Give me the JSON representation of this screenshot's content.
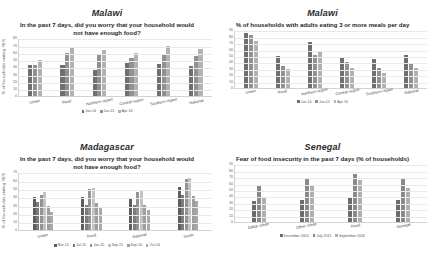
{
  "figure": {
    "y_axis_label": "% of households stating YES"
  },
  "panels": [
    {
      "id": "malawi-worry",
      "country": "Malawi",
      "subtitle": "In the past 7 days, did you worry that your household would not have enough food?",
      "ylabel": "% of households stating YES",
      "legend_labels": [
        "Jun-14",
        "Jun-15",
        "Apr-16"
      ]
    },
    {
      "id": "malawi-meals",
      "country": "Malawi",
      "subtitle": "% of households with adults eating 3 or more meals per day",
      "ylabel": "",
      "legend_labels": [
        "Jun-14",
        "Jun-15",
        "Apr-16"
      ]
    },
    {
      "id": "madagascar-worry",
      "country": "Madagascar",
      "subtitle": "In the past 7 days, did you worry that your household would not have enough food?",
      "ylabel": "% of households stating YES",
      "legend_labels": [
        "Mar-14",
        "Jul-14",
        "Jan-15",
        "Sep-15",
        "Sep-16",
        "Oct-16"
      ]
    },
    {
      "id": "senegal-fear",
      "country": "Senegal",
      "subtitle": "Fear of food insecurity in the past 7 days (% of households)",
      "ylabel": "",
      "legend_labels": [
        "December 2014",
        "July 2015",
        "September 2016"
      ]
    }
  ],
  "chart_data": [
    {
      "type": "bar",
      "id": "malawi-worry",
      "title": "Malawi",
      "subtitle": "In the past 7 days, did you worry that your household would not have enough food?",
      "xlabel": "",
      "ylabel": "% of households stating YES",
      "ylim": [
        0,
        80
      ],
      "yticks": [
        0,
        10,
        20,
        30,
        40,
        50,
        60,
        70,
        80
      ],
      "grid": true,
      "legend_position": "bottom",
      "categories": [
        "Urban",
        "Rural",
        "Northern region",
        "Central region",
        "Southern region",
        "National"
      ],
      "series": [
        {
          "name": "Jun-14",
          "color": "#6f6f6f",
          "values": [
            44,
            44,
            36,
            46,
            45,
            42
          ]
        },
        {
          "name": "Jun-15",
          "color": "#919191",
          "values": [
            43,
            60,
            58,
            53,
            59,
            56
          ]
        },
        {
          "name": "Apr-16",
          "color": "#b3b3b3",
          "values": [
            50,
            68,
            64,
            60,
            70,
            66
          ]
        }
      ]
    },
    {
      "type": "bar",
      "id": "malawi-meals",
      "title": "Malawi",
      "subtitle": "% of households with adults eating 3 or more meals per day",
      "xlabel": "",
      "ylabel": "",
      "ylim": [
        0,
        90
      ],
      "yticks": [
        0,
        10,
        20,
        30,
        40,
        50,
        60,
        70,
        80,
        90
      ],
      "grid": true,
      "legend_position": "bottom",
      "categories": [
        "Urban",
        "Rural",
        "Northern region",
        "Central region",
        "Southern region",
        "National"
      ],
      "series": [
        {
          "name": "Jun-14",
          "color": "#6f6f6f",
          "values": [
            85,
            50,
            72,
            49,
            46,
            52
          ]
        },
        {
          "name": "Jun-15",
          "color": "#919191",
          "values": [
            83,
            35,
            51,
            40,
            32,
            37
          ]
        },
        {
          "name": "Apr-16",
          "color": "#b3b3b3",
          "values": [
            74,
            30,
            56,
            32,
            24,
            31
          ]
        }
      ]
    },
    {
      "type": "bar",
      "id": "madagascar-worry",
      "title": "Madagascar",
      "subtitle": "In the past 7 days, did you worry that your household would not have enough food?",
      "xlabel": "",
      "ylabel": "% of households stating YES",
      "ylim": [
        0,
        70
      ],
      "yticks": [
        0,
        10,
        20,
        30,
        40,
        50,
        60,
        70
      ],
      "grid": true,
      "legend_position": "bottom",
      "categories": [
        "Urban",
        "Rural",
        "National",
        "South"
      ],
      "series": [
        {
          "name": "Mar-14",
          "color": "#5e5e5e",
          "values": [
            40,
            40,
            38,
            52
          ]
        },
        {
          "name": "Jul-14",
          "color": "#7d7d7d",
          "values": [
            34,
            31,
            31,
            43
          ]
        },
        {
          "name": "Jan-15",
          "color": "#949494",
          "values": [
            43,
            50,
            46,
            62
          ]
        },
        {
          "name": "Sep-15",
          "color": "#c3c3c3",
          "values": [
            46,
            51,
            49,
            63
          ]
        },
        {
          "name": "Sep-16",
          "color": "#9e9e9e",
          "values": [
            30,
            33,
            31,
            42
          ]
        },
        {
          "name": "Oct-16",
          "color": "#a8a8a8",
          "values": [
            22,
            28,
            25,
            35
          ]
        }
      ]
    },
    {
      "type": "bar",
      "id": "senegal-fear",
      "title": "Senegal",
      "subtitle": "Fear of food insecurity in the past 7 days (% of households)",
      "xlabel": "",
      "ylabel": "",
      "ylim": [
        0,
        90
      ],
      "yticks": [
        0,
        10,
        20,
        30,
        40,
        50,
        60,
        70,
        80,
        90
      ],
      "grid": true,
      "legend_position": "bottom",
      "categories": [
        "Dakar urban",
        "Other urban",
        "Rural",
        "Senegal"
      ],
      "series": [
        {
          "name": "December 2014",
          "color": "#6b6b6b",
          "values": [
            33,
            35,
            38,
            34
          ]
        },
        {
          "name": "July 2015",
          "color": "#8a8a8a",
          "values": [
            56,
            68,
            75,
            67
          ]
        },
        {
          "name": "September 2016",
          "color": "#b0b0b0",
          "values": [
            37,
            56,
            66,
            53
          ]
        }
      ]
    }
  ]
}
